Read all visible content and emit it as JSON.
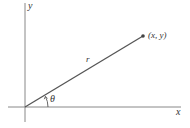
{
  "diagram": {
    "title": "",
    "colors": {
      "background": "#ffffff",
      "axis": "#888888",
      "ray": "#555555",
      "point": "#444444",
      "text": "#333333"
    },
    "axes": {
      "x_label": "x",
      "y_label": "y"
    },
    "point": {
      "label": "(x, y)"
    },
    "ray": {
      "label": "r"
    },
    "angle": {
      "label": "θ"
    }
  }
}
